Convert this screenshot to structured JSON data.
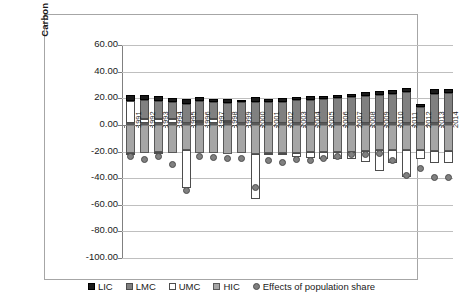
{
  "chart_data": {
    "type": "bar",
    "title": "",
    "xlabel": "",
    "ylabel": "Carbon emissions (MtC)",
    "ylim": [
      -100,
      60
    ],
    "ytick_labels": [
      "60.00",
      "40.00",
      "20.00",
      "0.00",
      "-20.00",
      "-40.00",
      "-60.00",
      "-80.00",
      "-100.00"
    ],
    "ytick_values": [
      60,
      40,
      20,
      0,
      -20,
      -40,
      -60,
      -80,
      -100
    ],
    "grid": true,
    "stacked": true,
    "legend_position": "bottom",
    "categories": [
      "1991",
      "1992",
      "1993",
      "1994",
      "1995",
      "1996",
      "1997",
      "1998",
      "1999",
      "2000",
      "2001",
      "2002",
      "2003",
      "2004",
      "2005",
      "2006",
      "2007",
      "2008",
      "2009",
      "2010",
      "2011",
      "2012",
      "2013",
      "2014"
    ],
    "series": [
      {
        "name": "LIC",
        "color": "#1a1a1a",
        "values": [
          5.0,
          3.5,
          3.2,
          3.0,
          3.5,
          2.8,
          2.6,
          2.6,
          2.0,
          3.6,
          2.2,
          2.4,
          2.3,
          2.4,
          2.3,
          2.4,
          2.5,
          2.6,
          2.6,
          2.8,
          2.8,
          2.3,
          3.2,
          3.2
        ]
      },
      {
        "name": "LMC",
        "color": "#808080",
        "values": [
          16.5,
          19.0,
          18.3,
          17.5,
          16.0,
          18.0,
          17.0,
          16.5,
          17.0,
          17.5,
          17.0,
          17.5,
          18.5,
          19.0,
          19.5,
          20.0,
          21.0,
          22.0,
          22.5,
          23.5,
          25.0,
          13.5,
          23.5,
          24.0
        ]
      },
      {
        "name": "UMC",
        "color": "#ffffff",
        "values": [
          -22.0,
          -20.5,
          -20.3,
          -19.8,
          -47.5,
          -21.0,
          -21.0,
          -20.0,
          -20.5,
          -56.0,
          -22.0,
          -23.0,
          -24.0,
          -25.0,
          -26.0,
          -25.5,
          -26.0,
          -28.0,
          -35.0,
          -29.0,
          -39.0,
          -25.5,
          -28.5,
          -29.0
        ]
      },
      {
        "name": "HIC",
        "color": "#a6a6a6",
        "values": [
          -21.5,
          -21.5,
          -20.0,
          -21.5,
          -19.0,
          -21.0,
          -21.5,
          -22.0,
          -21.5,
          -22.0,
          -21.5,
          -21.0,
          -21.0,
          -20.5,
          -20.0,
          -20.0,
          -20.0,
          -19.5,
          -19.0,
          -19.0,
          -19.0,
          -18.5,
          -19.5,
          -19.5
        ]
      }
    ],
    "positive_stack_tops": [
      38.0,
      25.5,
      24.5,
      23.5,
      20.0,
      22.5,
      21.5,
      20.5,
      19.5,
      22.5,
      19.8,
      20.5,
      21.3,
      22.0,
      22.3,
      22.8,
      23.8,
      25.0,
      25.5,
      26.8,
      28.3,
      16.0,
      27.2,
      27.6
    ],
    "marker_series": {
      "name": "Effects of population share",
      "color": "#808080",
      "marker": "circle",
      "values": [
        -24.0,
        -26.0,
        -24.0,
        -30.0,
        -49.5,
        -24.0,
        -24.5,
        -25.0,
        -25.5,
        -47.0,
        -27.0,
        -28.0,
        -26.0,
        -26.5,
        -25.5,
        -24.0,
        -22.5,
        -22.0,
        -21.5,
        -27.0,
        -38.0,
        -32.5,
        -39.5,
        -39.5
      ]
    }
  },
  "legend": {
    "items": [
      {
        "label": "LIC",
        "key": "lic"
      },
      {
        "label": "LMC",
        "key": "lmc"
      },
      {
        "label": "UMC",
        "key": "umc"
      },
      {
        "label": "HIC",
        "key": "hic"
      },
      {
        "label": "Effects of population share",
        "key": "dot"
      }
    ]
  }
}
